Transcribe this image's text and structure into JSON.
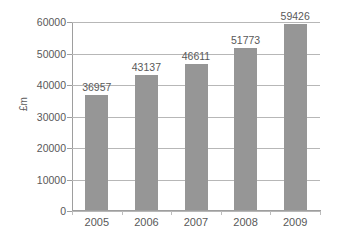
{
  "chart_data": {
    "type": "bar",
    "title": "",
    "subtitle": "",
    "xlabel": "",
    "ylabel": "£m",
    "categories": [
      "2005",
      "2006",
      "2007",
      "2008",
      "2009"
    ],
    "values": [
      36957,
      43137,
      46611,
      51773,
      59426
    ],
    "data_labels": [
      "36957",
      "43137",
      "46611",
      "51773",
      "59426"
    ],
    "ylim": [
      0,
      60000
    ],
    "ytick_values": [
      0,
      10000,
      20000,
      30000,
      40000,
      50000,
      60000
    ],
    "ytick_labels": [
      "0",
      "10000",
      "20000",
      "30000",
      "40000",
      "50000",
      "60000"
    ],
    "grid": true,
    "grid_axis": "y",
    "legend": false,
    "legend_position": "none",
    "series": [
      {
        "name": "£m",
        "values": [
          36957,
          43137,
          46611,
          51773,
          59426
        ]
      }
    ],
    "colors": {
      "bar_fill": "#969696",
      "gridline": "#b7b7b7",
      "axis_line": "#9e9e9e",
      "text": "#595959",
      "background": "#ffffff"
    }
  }
}
